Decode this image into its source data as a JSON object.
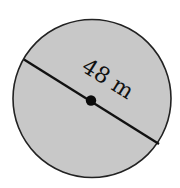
{
  "diagram": {
    "shape": "circle",
    "label": "48 m",
    "measurement": {
      "value": 48,
      "unit": "m",
      "quantity": "diameter"
    },
    "colors": {
      "fill": "#c8c8c8",
      "stroke": "#222222",
      "line": "#111111",
      "center_dot": "#0a0a0a",
      "background": "#ffffff"
    }
  }
}
